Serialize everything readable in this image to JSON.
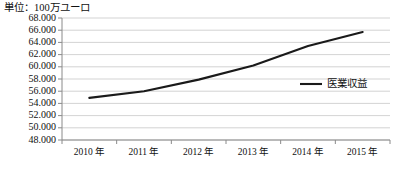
{
  "chart_data": {
    "type": "line",
    "title": "単位：100万ユーロ",
    "xlabel": "",
    "ylabel": "",
    "categories": [
      "2010 年",
      "2011 年",
      "2012 年",
      "2013 年",
      "2014 年",
      "2015 年"
    ],
    "series": [
      {
        "name": "医業収益",
        "values": [
          54900,
          56000,
          57900,
          60200,
          63400,
          65700
        ],
        "color": "#1a1a1a"
      }
    ],
    "ylim": [
      48000,
      68000
    ],
    "yticks": [
      48000,
      50000,
      52000,
      54000,
      56000,
      58000,
      60000,
      62000,
      64000,
      66000,
      68000
    ],
    "ytick_labels": [
      "48.000",
      "50.000",
      "52.000",
      "54.000",
      "56.000",
      "58.000",
      "60.000",
      "62.000",
      "64.000",
      "66.000",
      "68.000"
    ],
    "grid": true,
    "grid_color": "#c8c8c8",
    "axis_color": "#8a8a8a",
    "legend_position": "inside-right"
  },
  "legend": {
    "entries": [
      {
        "label": "医業収益",
        "color": "#1a1a1a"
      }
    ]
  }
}
